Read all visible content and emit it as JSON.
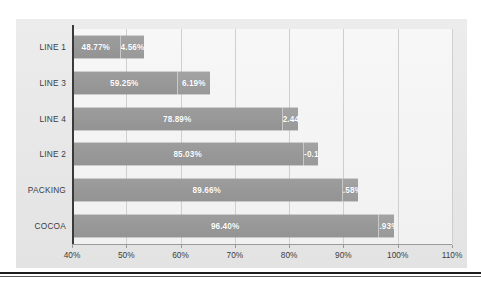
{
  "chart_data": {
    "type": "bar",
    "orientation": "horizontal",
    "stacked": true,
    "title": "",
    "subtitle": "",
    "xlabel": "",
    "ylabel": "",
    "xlim": [
      40,
      110
    ],
    "xtick_step": 10,
    "grid": true,
    "legend": "none",
    "categories": [
      "LINE 1",
      "LINE 3",
      "LINE 4",
      "LINE 2",
      "PACKING",
      "COCOA"
    ],
    "xticks": [
      {
        "value": 40,
        "label": "40%"
      },
      {
        "value": 50,
        "label": "50%"
      },
      {
        "value": 60,
        "label": "60%"
      },
      {
        "value": 70,
        "label": "70%"
      },
      {
        "value": 80,
        "label": "80%"
      },
      {
        "value": 90,
        "label": "90%"
      },
      {
        "value": 100,
        "label": "100%"
      },
      {
        "value": 110,
        "label": "110%"
      }
    ],
    "series": [
      {
        "name": "Base",
        "values": [
          48.77,
          59.25,
          78.89,
          85.03,
          89.66,
          96.4
        ],
        "labels": [
          "48.77%",
          "59.25%",
          "78.89%",
          "85.03%",
          "89.66%",
          "96.40%"
        ],
        "color": "#969696"
      },
      {
        "name": "Delta",
        "values": [
          4.56,
          6.19,
          2.44,
          -0.1,
          2.58,
          2.93
        ],
        "labels": [
          "4.56%",
          "6.19%",
          "2.44",
          "-0.1",
          "2.58%",
          "2.93%"
        ],
        "color": "#9c9c9c"
      }
    ],
    "bars": [
      {
        "category": "LINE 1",
        "base": 48.77,
        "base_label": "48.77%",
        "delta": 4.56,
        "delta_label": "4.56%",
        "total": 53.33
      },
      {
        "category": "LINE 3",
        "base": 59.25,
        "base_label": "59.25%",
        "delta": 6.19,
        "delta_label": "6.19%",
        "total": 65.44
      },
      {
        "category": "LINE 4",
        "base": 78.89,
        "base_label": "78.89%",
        "delta": 2.44,
        "delta_label": "2.44",
        "total": 81.33
      },
      {
        "category": "LINE 2",
        "base": 85.03,
        "base_label": "85.03%",
        "delta": -0.1,
        "delta_label": "-0.1",
        "total": 85.03
      },
      {
        "category": "PACKING",
        "base": 89.66,
        "base_label": "89.66%",
        "delta": 2.58,
        "delta_label": "2.58%",
        "total": 92.24
      },
      {
        "category": "COCOA",
        "base": 96.4,
        "base_label": "96.40%",
        "delta": 2.93,
        "delta_label": "2.93%",
        "total": 99.33
      }
    ],
    "colors": {
      "bar_primary": "#969696",
      "bar_secondary": "#9c9c9c",
      "panel_background": "#e9e9e9",
      "plot_background": "#f4f4f4",
      "gridline": "#cfcfcf",
      "axis_line": "#3a3a3a",
      "label_text": "#3c3c3c",
      "bar_label_text": "#ffffff"
    }
  }
}
